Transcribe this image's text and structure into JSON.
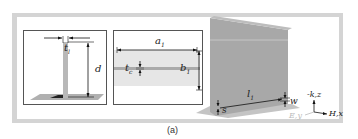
{
  "figure": {
    "caption": "(a)",
    "panels": {
      "side_view": {
        "labels": {
          "thickness": "t",
          "thickness_sub": "l",
          "height": "d"
        }
      },
      "top_view": {
        "labels": {
          "length": "a",
          "length_sub": "1",
          "width": "b",
          "width_sub": "1",
          "gap": "t",
          "gap_sub": "c"
        }
      },
      "perspective_view": {
        "labels": {
          "length": "l",
          "length_sub": "1",
          "slot_width": "w",
          "spacing": "s"
        }
      }
    },
    "axes": {
      "k_label": "-k,z",
      "e_label": "E,y",
      "h_label": "H,x"
    },
    "colors": {
      "frame": "#d4d4d4",
      "plate": "#a8a8a8",
      "ground": "#b0b0b0",
      "strip": "#e6e6e6"
    }
  }
}
